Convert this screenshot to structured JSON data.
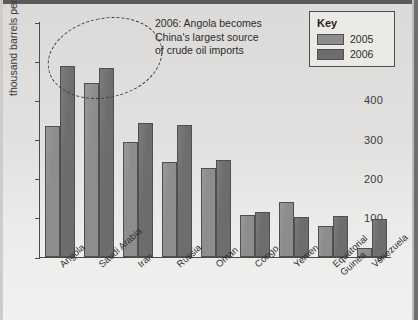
{
  "chart_data": {
    "type": "bar",
    "title": "",
    "xlabel": "",
    "ylabel": "thousand barrels per day",
    "ylim": [
      0,
      600
    ],
    "yticks": [
      0,
      100,
      200,
      300,
      400,
      500,
      600
    ],
    "grid": false,
    "legend_position": "top-right",
    "categories": [
      "Angola",
      "Saudi Arabia",
      "Iran",
      "Russia",
      "Oman",
      "Congo",
      "Yemen",
      "Equatorial\nGuinea",
      "Venezuela"
    ],
    "series": [
      {
        "name": "2005",
        "color": "#8d8d8d",
        "values": [
          334,
          444,
          294,
          242,
          228,
          107,
          140,
          78,
          22
        ]
      },
      {
        "name": "2006",
        "color": "#6d6d6d",
        "values": [
          488,
          483,
          343,
          337,
          248,
          116,
          103,
          104,
          96
        ]
      }
    ],
    "annotations": [
      {
        "text": "2006: Angola becomes\nChina's largest source\nof crude oil imports",
        "shape": "dashed-ellipse"
      }
    ]
  },
  "axis": {
    "y_title": "thousand barrels per day",
    "tick_labels": [
      "600",
      "500",
      "400",
      "300",
      "200",
      "100",
      "0"
    ]
  },
  "legend": {
    "title": "Key",
    "items": [
      {
        "label": "2005",
        "color": "#8d8d8d"
      },
      {
        "label": "2006",
        "color": "#6d6d6d"
      }
    ]
  },
  "annotation": {
    "text": "2006: Angola becomes\nChina's largest source\nof crude oil imports"
  }
}
